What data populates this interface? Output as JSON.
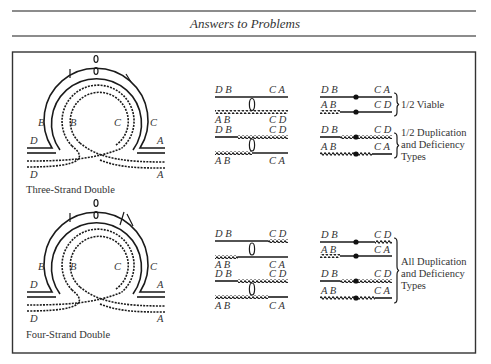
{
  "header": {
    "title": "Answers to Problems"
  },
  "figure": {
    "three_strand": {
      "caption": "Three-Strand Double",
      "labels": {
        "outer_left": "B",
        "inner_left": "B",
        "inner_right": "C",
        "outer_right": "C",
        "top_left": "D",
        "top_right": "A",
        "bottom_left": "D",
        "bottom_right": "A"
      },
      "chromatid_pairs": [
        {
          "top": {
            "left": "D B",
            "right": "C A"
          },
          "bottom": {
            "left": "A B",
            "right": "C D"
          }
        },
        {
          "top": {
            "left": "D B",
            "right": "C D"
          },
          "bottom": {
            "left": "A B",
            "right": "C A"
          }
        }
      ],
      "products": [
        {
          "top": {
            "left": "D B",
            "right": "C A"
          },
          "bottom": {
            "left": "A B",
            "right": "C D"
          },
          "note": [
            "1/2 Viable"
          ]
        },
        {
          "top": {
            "left": "D B",
            "right": "C D"
          },
          "bottom": {
            "left": "A B",
            "right": "C A"
          },
          "note": [
            "1/2 Duplication",
            "and Deficiency",
            "Types"
          ]
        }
      ]
    },
    "four_strand": {
      "caption": "Four-Strand Double",
      "labels": {
        "outer_left": "B",
        "inner_left": "B",
        "inner_right": "C",
        "outer_right": "C",
        "top_left": "D",
        "top_right": "A",
        "bottom_left": "D",
        "bottom_right": "A"
      },
      "chromatid_pairs": [
        {
          "top": {
            "left": "D B",
            "right": "C D"
          },
          "bottom": {
            "left": "A B",
            "right": "C A"
          }
        },
        {
          "top": {
            "left": "D B",
            "right": "C D"
          },
          "bottom": {
            "left": "A B",
            "right": "C A"
          }
        }
      ],
      "products": [
        {
          "top": {
            "left": "D B",
            "right": "C D"
          },
          "bottom": {
            "left": "A B",
            "right": "C A"
          }
        },
        {
          "top": {
            "left": "D B",
            "right": "C D"
          },
          "bottom": {
            "left": "A B",
            "right": "C A"
          }
        }
      ],
      "note": [
        "All Duplication",
        "and Deficiency",
        "Types"
      ]
    }
  }
}
